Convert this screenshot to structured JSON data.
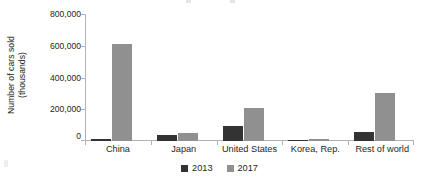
{
  "chart_data": {
    "type": "bar",
    "title": "",
    "xlabel": "",
    "ylabel": "Number of cars sold\n(thousands)",
    "ylabel_lines": [
      "Number of cars sold",
      "(thousands)"
    ],
    "categories": [
      "China",
      "Japan",
      "United States",
      "Korea, Rep.",
      "Rest of world"
    ],
    "series": [
      {
        "name": "2013",
        "color": "#333333",
        "values": [
          15000,
          40000,
          96000,
          2000,
          58000
        ]
      },
      {
        "name": "2017",
        "color": "#909090",
        "values": [
          608000,
          52000,
          205000,
          15000,
          300000
        ]
      }
    ],
    "ylim": [
      0,
      800000
    ],
    "ytick_values": [
      800000,
      600000,
      400000,
      200000,
      0
    ],
    "ytick_labels": [
      "800,000",
      "600,000",
      "400,000",
      "200,000",
      "0"
    ],
    "grid": false,
    "legend_position": "bottom-center",
    "legend_entries": [
      "2013",
      "2017"
    ],
    "axis_color": "#b2b2b2",
    "text_color": "#231f20"
  }
}
